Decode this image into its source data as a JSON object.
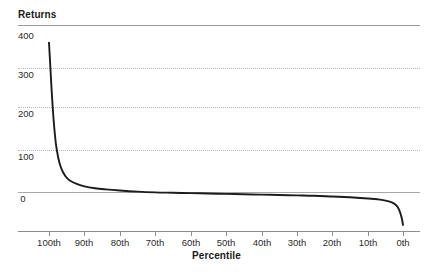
{
  "figure": {
    "background_color": "#ffffff",
    "curve_color": "#1c1c1c",
    "gridline_color": "#b6b6b6",
    "axis_color": "#8d8d8d",
    "caption_text": ""
  },
  "chart_data": {
    "type": "line",
    "title": "",
    "ylabel": "Returns",
    "xlabel": "Percentile",
    "ylim": [
      -40,
      400
    ],
    "y_ticks": [
      0,
      100,
      200,
      300,
      400
    ],
    "y_tick_labels": [
      "0",
      "100",
      "200",
      "300",
      "400"
    ],
    "x_ticks": [
      100,
      90,
      80,
      70,
      60,
      50,
      40,
      30,
      20,
      10,
      0
    ],
    "x_tick_labels": [
      "100th",
      "90th",
      "80th",
      "70th",
      "60th",
      "50th",
      "40th",
      "30th",
      "20th",
      "10th",
      "0th"
    ],
    "x_axis_direction": "descending",
    "grid": "horizontal-dotted",
    "legend": "none",
    "series": [
      {
        "name": "Returns by percentile",
        "x": [
          100,
          99.6,
          99.2,
          98.8,
          98.4,
          98,
          97.4,
          96.8,
          96,
          95,
          94,
          92,
          90,
          87,
          84,
          80,
          75,
          70,
          65,
          60,
          55,
          50,
          45,
          40,
          35,
          30,
          25,
          20,
          15,
          12,
          9,
          6,
          4,
          2.5,
          1.5,
          0.8,
          0.3,
          0
        ],
        "y": [
          398,
          330,
          262,
          205,
          160,
          125,
          92,
          70,
          52,
          38,
          30,
          21,
          15,
          10,
          7,
          4,
          1,
          -1,
          -2,
          -3,
          -4,
          -5,
          -6,
          -7,
          -8,
          -9,
          -10,
          -12,
          -14,
          -16,
          -18,
          -21,
          -25,
          -31,
          -40,
          -55,
          -72,
          -88
        ]
      }
    ],
    "annotations": []
  },
  "geometry": {
    "plot_left": 49,
    "plot_right": 403,
    "y_zero_px": 192,
    "y_400_px": 42,
    "x_axis_px": 231
  }
}
